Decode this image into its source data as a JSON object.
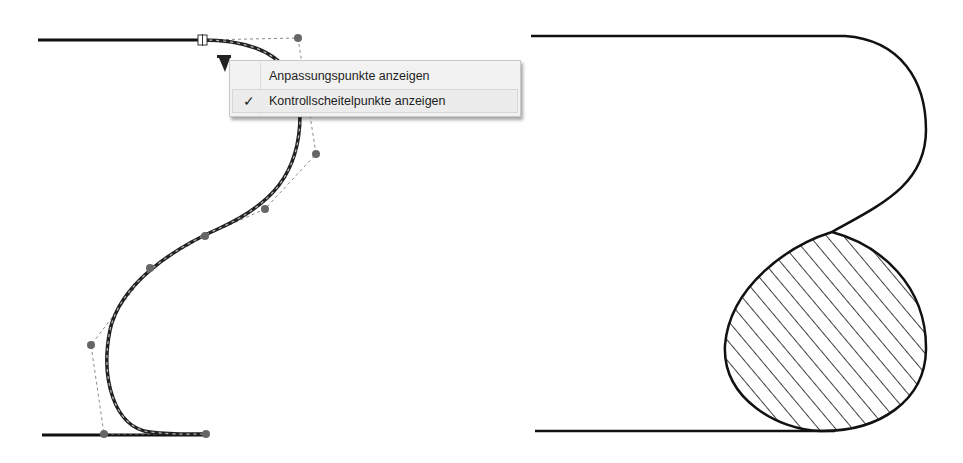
{
  "context_menu": {
    "items": [
      {
        "label": "Anpassungspunkte anzeigen",
        "checked": false,
        "check_glyph": ""
      },
      {
        "label": "Kontrollscheitelpunkte anzeigen",
        "checked": true,
        "check_glyph": "✓"
      }
    ]
  },
  "drawing": {
    "line_color": "#111111",
    "control_point_color": "#666666",
    "left_view": "spline-edit-mode-with-control-vertices",
    "right_view": "result-profile-with-hatched-region",
    "icons": [
      "context-menu-trigger-triangle-icon",
      "spline-endpoint-handle-icon",
      "control-vertex-icon"
    ]
  }
}
